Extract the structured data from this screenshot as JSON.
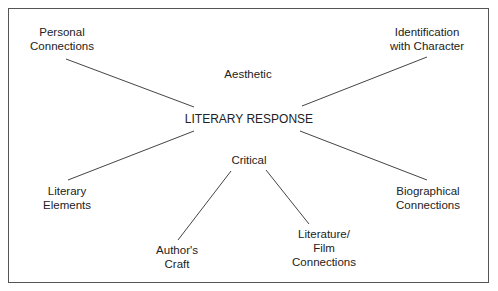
{
  "diagram": {
    "center": "LITERARY RESPONSE",
    "stance_labels": {
      "aesthetic": "Aesthetic",
      "critical": "Critical"
    },
    "nodes": {
      "personal": [
        "Personal",
        "Connections"
      ],
      "identification": [
        "Identification",
        "with Character"
      ],
      "literary_elements": [
        "Literary",
        "Elements"
      ],
      "biographical": [
        "Biographical",
        "Connections"
      ],
      "authors_craft": [
        "Author's",
        "Craft"
      ],
      "lit_film": [
        "Literature/",
        "Film",
        "Connections"
      ]
    },
    "colors": {
      "line": "#444444",
      "text": "#222222",
      "border": "#555555"
    }
  }
}
